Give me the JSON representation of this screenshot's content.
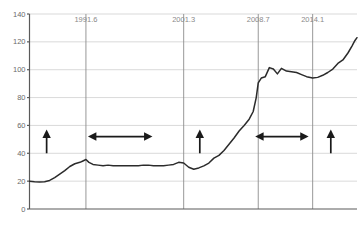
{
  "chart_data": {
    "type": "line",
    "title": "",
    "subtitle": "",
    "xlabel": "",
    "ylabel": "",
    "ylim": [
      0,
      140
    ],
    "yticks": [
      0,
      20,
      40,
      60,
      80,
      100,
      120,
      140
    ],
    "ytick_labels": [
      "0",
      "20",
      "40",
      "60",
      "80",
      "100",
      "120",
      "140"
    ],
    "grid": true,
    "legend": false,
    "x_marker_labels": [
      "1991.6",
      "2001.3",
      "2008.7",
      "2014.1"
    ],
    "x_markers": [
      1991.6,
      2001.3,
      2008.7,
      2014.1
    ],
    "xlim": [
      1986.0,
      2018.5
    ],
    "series": [
      {
        "name": "index",
        "x": [
          1986.0,
          1986.5,
          1987.0,
          1987.5,
          1988.0,
          1988.5,
          1989.0,
          1989.5,
          1990.0,
          1990.5,
          1991.0,
          1991.3,
          1991.6,
          1991.9,
          1992.3,
          1992.8,
          1993.3,
          1993.8,
          1994.3,
          1994.8,
          1995.3,
          1995.8,
          1996.3,
          1996.8,
          1997.3,
          1997.8,
          1998.3,
          1998.8,
          1999.3,
          1999.8,
          2000.3,
          2000.8,
          2001.3,
          2001.8,
          2002.3,
          2002.8,
          2003.3,
          2003.8,
          2004.3,
          2004.8,
          2005.3,
          2005.8,
          2006.3,
          2006.8,
          2007.3,
          2007.8,
          2008.2,
          2008.5,
          2008.7,
          2009.0,
          2009.4,
          2009.8,
          2010.2,
          2010.6,
          2011.0,
          2011.5,
          2012.0,
          2012.5,
          2013.0,
          2013.5,
          2014.1,
          2014.6,
          2015.1,
          2015.6,
          2016.1,
          2016.6,
          2017.1,
          2017.6,
          2018.0,
          2018.3,
          2018.5
        ],
        "y": [
          20.0,
          19.6,
          19.3,
          19.5,
          20.5,
          22.5,
          25.0,
          27.5,
          30.5,
          32.5,
          33.5,
          34.5,
          35.5,
          33.5,
          32.0,
          31.5,
          31.0,
          31.5,
          31.0,
          31.0,
          31.0,
          31.0,
          31.0,
          31.0,
          31.5,
          31.5,
          31.0,
          31.0,
          31.0,
          31.5,
          32.0,
          33.5,
          33.0,
          30.0,
          28.5,
          29.5,
          31.0,
          33.0,
          36.5,
          38.5,
          42.0,
          46.5,
          51.0,
          56.0,
          60.0,
          64.5,
          70.0,
          80.0,
          90.5,
          94.0,
          95.0,
          101.5,
          100.5,
          97.0,
          101.0,
          99.0,
          98.5,
          98.0,
          96.5,
          95.0,
          94.0,
          94.5,
          96.0,
          98.0,
          100.5,
          104.5,
          107.0,
          112.0,
          117.0,
          121.0,
          123.0
        ]
      }
    ],
    "annotations": [
      {
        "name": "phase-1-rise",
        "type": "arrow-up",
        "x": 1987.7,
        "y_from": 40.0,
        "y_to": 57.0
      },
      {
        "name": "phase-2-flat",
        "type": "arrow-horizontal",
        "x_from": 1991.8,
        "y": 52.0,
        "x_to": 1998.2
      },
      {
        "name": "phase-3-rise",
        "type": "arrow-up",
        "x": 2002.9,
        "y_from": 40.0,
        "y_to": 57.0
      },
      {
        "name": "phase-4-flat",
        "type": "arrow-horizontal",
        "x_from": 2008.4,
        "y": 52.0,
        "x_to": 2013.7
      },
      {
        "name": "phase-5-rise",
        "type": "arrow-up",
        "x": 2015.9,
        "y_from": 40.0,
        "y_to": 57.0
      }
    ],
    "footnote": ""
  }
}
